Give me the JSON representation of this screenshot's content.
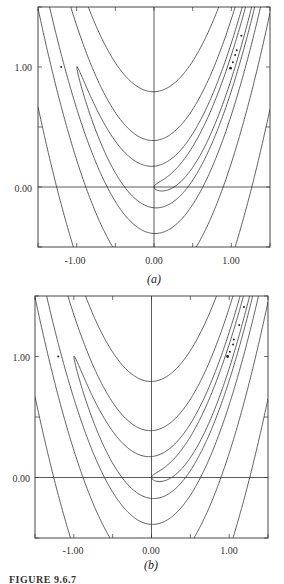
{
  "chart_data": [
    {
      "type": "contour",
      "panel_label": "(a)",
      "function": "f(x,y) = 100(y - x^2)^2 + (1 - x)^2",
      "contour_levels": [
        1,
        4,
        16,
        64,
        256
      ],
      "xlim": [
        -1.5,
        1.5
      ],
      "ylim": [
        -0.5,
        1.5
      ],
      "x_tick_labels": [
        "-1.00",
        "0.00",
        "1.00"
      ],
      "x_ticks": [
        -1.0,
        0.0,
        1.0
      ],
      "y_tick_labels": [
        "1.00",
        "0.00"
      ],
      "y_ticks": [
        1.0,
        0.0
      ],
      "minor_ticks_step": 0.5,
      "axes_lines": {
        "x0": true,
        "y0": true
      },
      "iterate_points": [
        {
          "x": -1.2,
          "y": 1.0
        },
        {
          "x": 0.99,
          "y": 0.99
        },
        {
          "x": 1.02,
          "y": 1.04
        },
        {
          "x": 1.05,
          "y": 1.1
        },
        {
          "x": 1.07,
          "y": 1.14
        },
        {
          "x": 1.13,
          "y": 1.26
        }
      ],
      "frame_px": {
        "left": 38,
        "top": 7,
        "right": 270,
        "bottom": 247
      },
      "xlabel": "",
      "ylabel": "",
      "title": ""
    },
    {
      "type": "contour",
      "panel_label": "(b)",
      "function": "f(x,y) = 100(y - x^2)^2 + (1 - x)^2",
      "contour_levels": [
        1,
        4,
        16,
        64,
        256
      ],
      "xlim": [
        -1.5,
        1.5
      ],
      "ylim": [
        -0.5,
        1.5
      ],
      "x_tick_labels": [
        "-1.00",
        "0.00",
        "1.00"
      ],
      "x_ticks": [
        -1.0,
        0.0,
        1.0
      ],
      "y_tick_labels": [
        "1.00",
        "0.00"
      ],
      "y_ticks": [
        1.0,
        0.0
      ],
      "minor_ticks_step": 0.5,
      "axes_lines": {
        "x0": true,
        "y0": true
      },
      "iterate_points": [
        {
          "x": -1.2,
          "y": 1.0
        },
        {
          "x": 0.98,
          "y": 1.0
        },
        {
          "x": 1.01,
          "y": 1.04
        },
        {
          "x": 1.05,
          "y": 1.1
        },
        {
          "x": 1.06,
          "y": 1.14
        },
        {
          "x": 1.13,
          "y": 1.26
        },
        {
          "x": 1.19,
          "y": 1.41
        }
      ],
      "frame_px": {
        "left": 35,
        "top": 296,
        "right": 268,
        "bottom": 538
      },
      "xlabel": "",
      "ylabel": "",
      "title": ""
    }
  ],
  "figure": {
    "caption": "FIGURE 9.6.7",
    "line_color": "#333333",
    "point_color": "#222222"
  }
}
